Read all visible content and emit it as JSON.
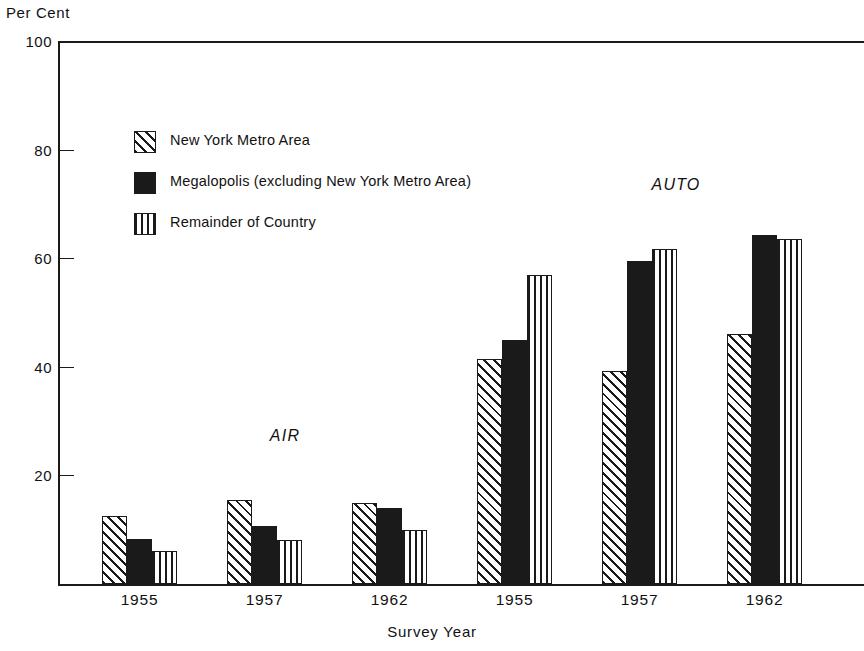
{
  "chart_data": {
    "type": "bar",
    "title": "",
    "xlabel": "Survey Year",
    "ylabel": "Per Cent",
    "ylim": [
      0,
      100
    ],
    "yticks": [
      20,
      40,
      60,
      80,
      100
    ],
    "ytick_labels": [
      "20",
      "40",
      "60",
      "80",
      "100"
    ],
    "grid": false,
    "legend_position": "upper-left-inside",
    "categories": [
      "1955",
      "1957",
      "1962",
      "1955",
      "1957",
      "1962"
    ],
    "group_annotations": [
      {
        "label": "AIR",
        "covers": [
          "1955",
          "1957",
          "1962"
        ]
      },
      {
        "label": "AUTO",
        "covers": [
          "1955",
          "1957",
          "1962"
        ]
      }
    ],
    "series": [
      {
        "name": "New York Metro Area",
        "fill": "diagonal-hatch",
        "values": [
          12.5,
          15.5,
          15.0,
          41.5,
          39.3,
          46.0
        ]
      },
      {
        "name": "Megalopolis (excluding New York Metro Area)",
        "fill": "solid-black",
        "values": [
          8.3,
          10.7,
          14.0,
          45.0,
          59.5,
          64.2
        ]
      },
      {
        "name": "Remainder of Country",
        "fill": "vertical-hatch",
        "values": [
          6.0,
          8.1,
          10.0,
          57.0,
          61.7,
          63.5
        ]
      }
    ],
    "colors": {
      "ink": "#1a1a1a",
      "background": "#ffffff"
    }
  },
  "legend": {
    "items": [
      {
        "label": "New York Metro Area",
        "fill": "diagonal-hatch"
      },
      {
        "label": "Megalopolis (excluding New York Metro Area)",
        "fill": "solid-black"
      },
      {
        "label": "Remainder of Country",
        "fill": "vertical-hatch"
      }
    ]
  },
  "axes": {
    "y_title": "Per Cent",
    "x_title": "Survey Year"
  }
}
